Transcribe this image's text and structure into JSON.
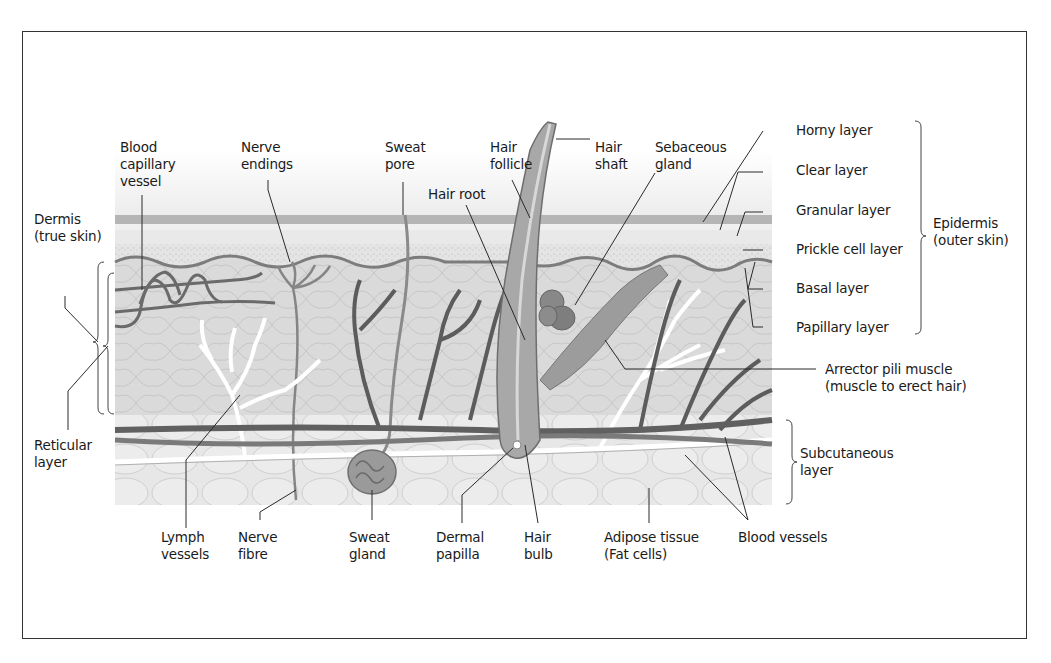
{
  "diagram": {
    "labels": {
      "blood_capillary_vessel": [
        "Blood",
        "capillary",
        "vessel"
      ],
      "nerve_endings": [
        "Nerve",
        "endings"
      ],
      "sweat_pore": [
        "Sweat",
        "pore"
      ],
      "hair_follicle": [
        "Hair",
        "follicle"
      ],
      "hair_shaft": [
        "Hair",
        "shaft"
      ],
      "sebaceous_gland": [
        "Sebaceous",
        "gland"
      ],
      "hair_root": [
        "Hair root"
      ],
      "dermis": [
        "Dermis",
        "(true skin)"
      ],
      "reticular_layer": [
        "Reticular",
        "layer"
      ],
      "horny_layer": [
        "Horny layer"
      ],
      "clear_layer": [
        "Clear layer"
      ],
      "granular_layer": [
        "Granular layer"
      ],
      "prickle_cell_layer": [
        "Prickle cell layer"
      ],
      "basal_layer": [
        "Basal layer"
      ],
      "papillary_layer": [
        "Papillary layer"
      ],
      "epidermis": [
        "Epidermis",
        "(outer skin)"
      ],
      "arrector_pili_muscle": [
        "Arrector pili muscle",
        "(muscle to erect hair)"
      ],
      "subcutaneous_layer": [
        "Subcutaneous",
        "layer"
      ],
      "lymph_vessels": [
        "Lymph",
        "vessels"
      ],
      "nerve_fibre": [
        "Nerve",
        "fibre"
      ],
      "sweat_gland": [
        "Sweat",
        "gland"
      ],
      "dermal_papilla": [
        "Dermal",
        "papilla"
      ],
      "hair_bulb": [
        "Hair",
        "bulb"
      ],
      "adipose_tissue": [
        "Adipose tissue",
        "(Fat cells)"
      ],
      "blood_vessels": [
        "Blood vessels"
      ]
    },
    "colors": {
      "frame": "#333333",
      "stratum_corneum": "#b8b8b8",
      "epidermis": "#e2e2e2",
      "dermis": "#d9d9d9",
      "subcutaneous": "#e6e6e6",
      "vessel_dark": "#5a5a5a",
      "vessel_mid": "#7a7a7a",
      "lymph": "#ffffff",
      "leader_line": "#2a2a2a"
    }
  }
}
